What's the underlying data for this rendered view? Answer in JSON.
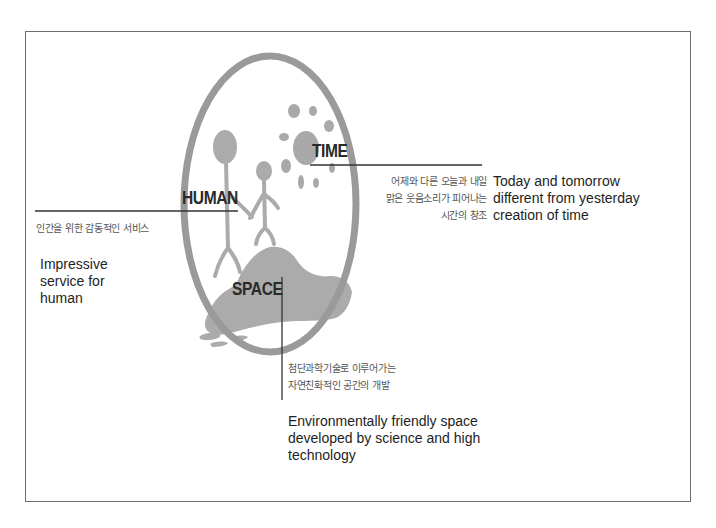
{
  "diagram": {
    "central_labels": {
      "human": "HUMAN",
      "time": "TIME",
      "space": "SPACE"
    },
    "human": {
      "korean": "인간을 위한 감동적인 서비스",
      "english_lines": [
        "Impressive",
        "service for",
        "human"
      ]
    },
    "time": {
      "korean_lines": [
        "어제와 다른 오늘과 내일",
        "맑은 웃음소리가 피어나는",
        "시간의 창조"
      ],
      "english_lines": [
        "Today and tomorrow",
        "different from yesterday",
        "creation of time"
      ]
    },
    "space": {
      "korean_lines": [
        "첨단과학기술로 이루어가는",
        "자연친화적인 공간의 개발"
      ],
      "english_lines": [
        "Environmentally friendly space",
        "developed by science and high",
        "technology"
      ]
    },
    "icons": {
      "oval": "oval-ring",
      "figures": "stick-figures-holding-hands",
      "sun": "sun-blob",
      "mountain": "mountain-island"
    },
    "colors": {
      "graphic_gray": "#a9a9a9",
      "oval_gray": "#9a9a9a",
      "line": "#333333",
      "frame": "#6e6e6e"
    }
  }
}
